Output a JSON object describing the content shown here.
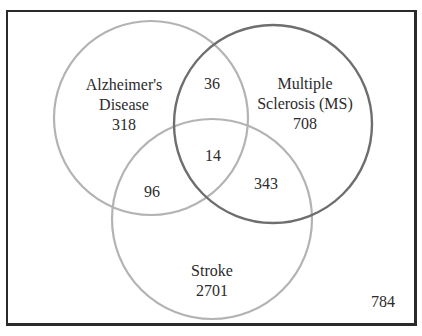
{
  "diagram": {
    "type": "venn",
    "sets": [
      {
        "id": "alzheimers",
        "name_line1": "Alzheimer's",
        "name_line2": "Disease",
        "only_count": "318",
        "stroke_color": "#b3b3b3"
      },
      {
        "id": "ms",
        "name_line1": "Multiple",
        "name_line2": "Sclerosis (MS)",
        "only_count": "708",
        "stroke_color": "#6e6e6e"
      },
      {
        "id": "stroke",
        "name_line1": "Stroke",
        "only_count": "2701",
        "stroke_color": "#b3b3b3"
      }
    ],
    "intersections": {
      "alzheimers_ms": "36",
      "alzheimers_stroke": "96",
      "ms_stroke": "343",
      "all_three": "14"
    },
    "outside": "784"
  }
}
